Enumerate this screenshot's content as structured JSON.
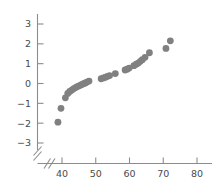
{
  "chart_data": {
    "type": "scatter",
    "title": "",
    "xlabel": "",
    "ylabel": "",
    "xlim": [
      37,
      82
    ],
    "ylim": [
      -3.4,
      3.4
    ],
    "grid": false,
    "legend": null,
    "axis_break": {
      "x": true,
      "y": true,
      "note": "double slash break near origin on both axes"
    },
    "x_ticks": [
      40,
      50,
      60,
      70,
      80
    ],
    "y_ticks": [
      -3,
      -2,
      -1,
      0,
      1,
      2,
      3
    ],
    "x_tick_labels": [
      "40",
      "50",
      "60",
      "70",
      "80"
    ],
    "y_tick_labels": [
      "-3",
      "-2",
      "-1",
      "0",
      "1",
      "2",
      "3"
    ],
    "marker": {
      "shape": "circle",
      "color": "#808080",
      "size": 3.4
    },
    "points": [
      {
        "x": 38.8,
        "y": -1.95
      },
      {
        "x": 39.7,
        "y": -1.25
      },
      {
        "x": 41.0,
        "y": -0.72
      },
      {
        "x": 41.7,
        "y": -0.5
      },
      {
        "x": 42.3,
        "y": -0.4
      },
      {
        "x": 42.9,
        "y": -0.33
      },
      {
        "x": 43.4,
        "y": -0.27
      },
      {
        "x": 43.9,
        "y": -0.22
      },
      {
        "x": 44.4,
        "y": -0.17
      },
      {
        "x": 44.9,
        "y": -0.13
      },
      {
        "x": 45.4,
        "y": -0.09
      },
      {
        "x": 45.9,
        "y": -0.05
      },
      {
        "x": 46.4,
        "y": -0.01
      },
      {
        "x": 46.9,
        "y": 0.03
      },
      {
        "x": 47.4,
        "y": 0.07
      },
      {
        "x": 48.0,
        "y": 0.12
      },
      {
        "x": 51.6,
        "y": 0.24
      },
      {
        "x": 52.3,
        "y": 0.28
      },
      {
        "x": 52.9,
        "y": 0.32
      },
      {
        "x": 53.5,
        "y": 0.36
      },
      {
        "x": 54.1,
        "y": 0.4
      },
      {
        "x": 55.8,
        "y": 0.5
      },
      {
        "x": 58.7,
        "y": 0.68
      },
      {
        "x": 59.3,
        "y": 0.72
      },
      {
        "x": 59.9,
        "y": 0.78
      },
      {
        "x": 61.3,
        "y": 0.9
      },
      {
        "x": 62.0,
        "y": 0.97
      },
      {
        "x": 62.6,
        "y": 1.03
      },
      {
        "x": 63.2,
        "y": 1.12
      },
      {
        "x": 63.8,
        "y": 1.2
      },
      {
        "x": 64.6,
        "y": 1.32
      },
      {
        "x": 65.9,
        "y": 1.55
      },
      {
        "x": 70.8,
        "y": 1.77
      },
      {
        "x": 72.1,
        "y": 2.15
      }
    ]
  }
}
